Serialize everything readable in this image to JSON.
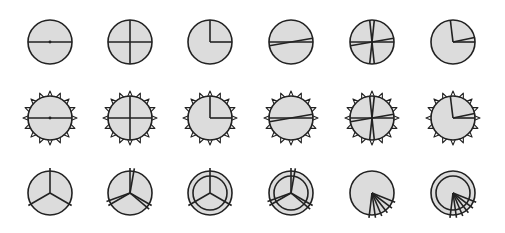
{
  "canvas": {
    "width": 505,
    "height": 233,
    "background": "#ffffff"
  },
  "style": {
    "fill": "#dcdcdc",
    "stroke": "#222222",
    "stroke_width": 1.6,
    "radius": 22,
    "inner_radius": 17,
    "tooth_count": 16,
    "tooth_height": 5
  },
  "columns_x": [
    50,
    130,
    210,
    291,
    372,
    453
  ],
  "rows": [
    {
      "name": "plain-circles",
      "y": 42,
      "shape": "circle",
      "items": [
        {
          "name": "horizontal-diameter",
          "lines": [
            [
              0,
              180
            ]
          ],
          "dot": true
        },
        {
          "name": "cross",
          "lines": [
            [
              0,
              180
            ],
            [
              90,
              270
            ]
          ]
        },
        {
          "name": "quarter-clock",
          "rays": [
            90,
            0
          ]
        },
        {
          "name": "narrow-wedge-diameter",
          "lines": [
            [
              0,
              180
            ],
            [
              10,
              190
            ]
          ]
        },
        {
          "name": "multi-chord",
          "lines": [
            [
              0,
              180
            ],
            [
              10,
              190
            ],
            [
              84,
              264
            ],
            [
              96,
              276
            ]
          ]
        },
        {
          "name": "pie-rays",
          "rays": [
            97,
            12,
            0
          ]
        }
      ]
    },
    {
      "name": "toothed-circles",
      "y": 118,
      "shape": "toothed",
      "items": [
        {
          "name": "horizontal-diameter",
          "lines": [
            [
              0,
              180
            ]
          ],
          "dot": true
        },
        {
          "name": "cross",
          "lines": [
            [
              0,
              180
            ],
            [
              90,
              270
            ]
          ]
        },
        {
          "name": "quarter-clock",
          "rays": [
            90,
            0
          ]
        },
        {
          "name": "narrow-wedge-diameter",
          "lines": [
            [
              0,
              180
            ],
            [
              10,
              190
            ]
          ]
        },
        {
          "name": "multi-chord",
          "lines": [
            [
              0,
              180
            ],
            [
              10,
              190
            ],
            [
              84,
              264
            ],
            [
              96,
              276
            ]
          ]
        },
        {
          "name": "pie-rays",
          "rays": [
            97,
            12,
            0
          ]
        }
      ]
    },
    {
      "name": "tri-spoke-circles",
      "y": 193,
      "shape": "circle",
      "items": [
        {
          "name": "three-spokes",
          "rays": [
            90,
            210,
            330
          ],
          "ring": false,
          "overshoot": 3
        },
        {
          "name": "double-three-spokes",
          "rays": [
            90,
            80,
            210,
            200,
            330,
            320
          ],
          "ring": false,
          "overshoot": 3
        },
        {
          "name": "ringed-three-spokes",
          "rays": [
            90,
            210,
            330
          ],
          "ring": true,
          "overshoot": 3
        },
        {
          "name": "ringed-double-three-spokes",
          "rays": [
            90,
            80,
            210,
            200,
            330,
            320
          ],
          "ring": true,
          "overshoot": 3
        },
        {
          "name": "fan-rays",
          "rays": [
            263,
            278,
            293,
            308,
            323,
            338
          ],
          "ring": false,
          "overshoot": 3
        },
        {
          "name": "ringed-fan-rays",
          "rays": [
            263,
            278,
            293,
            308,
            323,
            338
          ],
          "ring": true,
          "overshoot": 3
        }
      ]
    }
  ]
}
